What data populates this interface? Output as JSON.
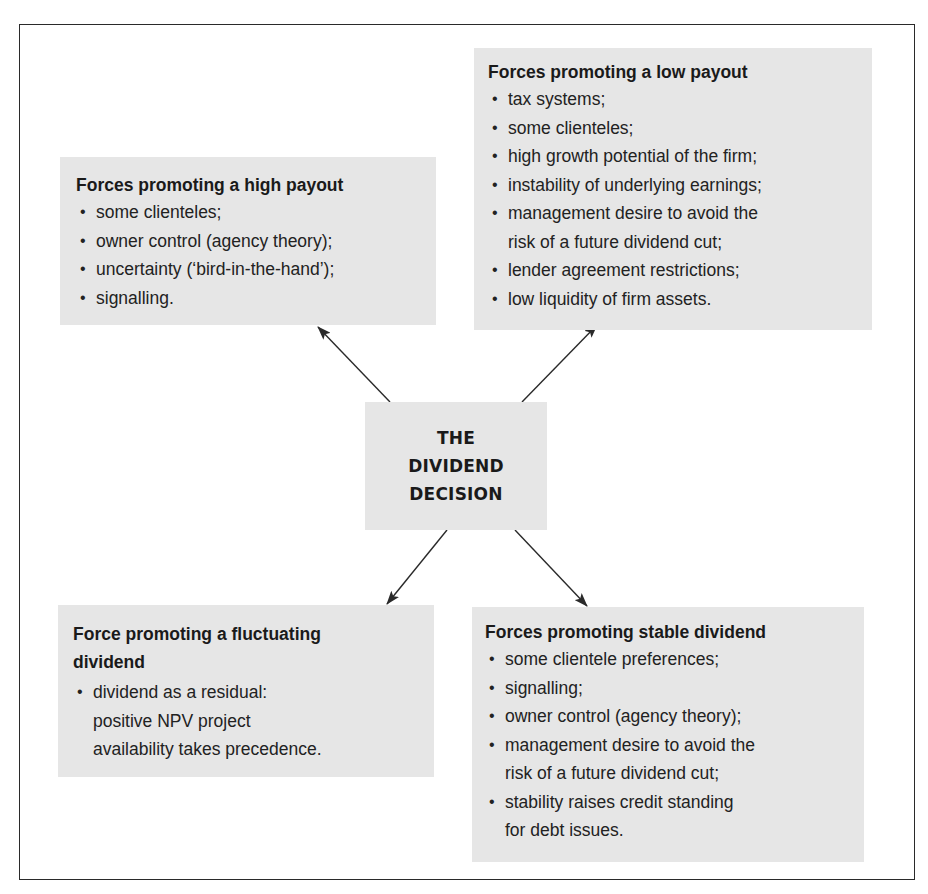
{
  "diagram": {
    "center": {
      "lines": [
        "THE",
        "DIVIDEND",
        "DECISION"
      ]
    },
    "boxes": {
      "high_payout": {
        "title": "Forces promoting a high payout",
        "items": [
          "some clienteles;",
          "owner control (agency theory);",
          "uncertainty (‘bird-in-the-hand’);",
          "signalling."
        ]
      },
      "low_payout": {
        "title": "Forces promoting a low payout",
        "items": [
          "tax systems;",
          "some clienteles;",
          "high growth potential of the firm;",
          "instability of underlying earnings;",
          [
            "management desire to avoid the",
            "risk of a future dividend cut;"
          ],
          "lender agreement restrictions;",
          "low liquidity of firm assets."
        ]
      },
      "fluctuating": {
        "title": "Force promoting a fluctuating dividend",
        "items": [
          [
            "dividend as a residual:",
            "positive NPV project",
            "availability takes precedence."
          ]
        ]
      },
      "stable": {
        "title": "Forces promoting stable dividend",
        "items": [
          "some clientele preferences;",
          "signalling;",
          "owner control (agency theory);",
          [
            "management desire to avoid the",
            "risk of a future dividend cut;"
          ],
          [
            "stability raises credit standing",
            "for debt issues."
          ]
        ]
      }
    },
    "colors": {
      "box_fill": "#e6e6e6",
      "frame": "#2a2a2a",
      "arrow": "#2a2a2a",
      "text": "#1c1c1c"
    }
  }
}
